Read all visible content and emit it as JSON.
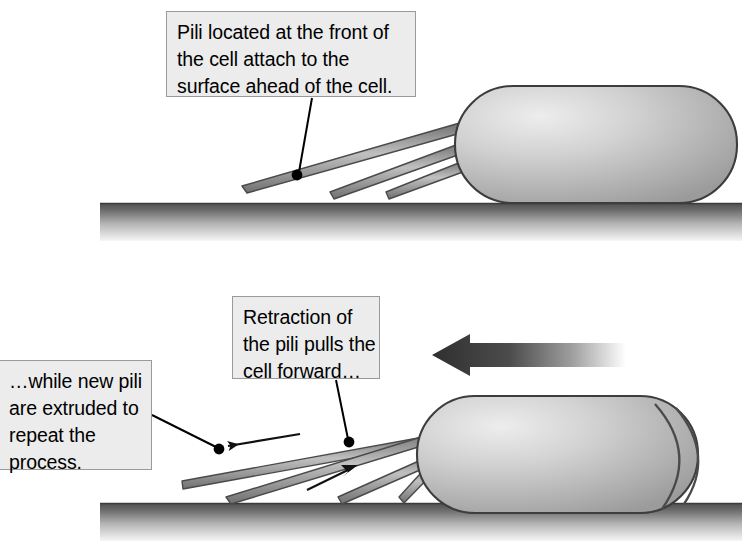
{
  "figure": {
    "type": "two-panel process diagram"
  },
  "colors": {
    "callout_fill": "#ececec",
    "callout_border": "#9a9a9a",
    "cell_outline": "#3d3d3d",
    "cell_light": "#e3e3e3",
    "cell_mid": "#b9b9b9",
    "cell_dark": "#9a9a9a",
    "pilus_outline": "#4a4a4a",
    "pilus_fill": "#b3b3b3",
    "surface_dark": "#555555",
    "surface_light": "#f2f2f2",
    "arrow_dark": "#3a3a3a",
    "leader": "#000000"
  },
  "panels": [
    {
      "id": "panel-top",
      "name": "attachment-stage",
      "callout": {
        "id": "box1",
        "lines": [
          "Pili located at the front of",
          "the cell attach to the",
          "surface ahead of the cell."
        ]
      },
      "cell": {
        "label": "bacterial-cell"
      },
      "pili_count": 3,
      "surface": {
        "label": "solid-surface"
      }
    },
    {
      "id": "panel-bottom",
      "name": "retraction-stage",
      "callouts": [
        {
          "id": "box2",
          "lines": [
            "Retraction of",
            "the pili pulls the",
            "cell forward…"
          ]
        },
        {
          "id": "box3",
          "lines": [
            "…while new pili",
            "are extruded to",
            "repeat the",
            "process."
          ]
        }
      ],
      "cell": {
        "label": "bacterial-cell"
      },
      "pili_count": 4,
      "surface": {
        "label": "solid-surface"
      },
      "direction_arrow": {
        "label": "movement-direction-arrow",
        "points": "left"
      },
      "motion_lines": 2,
      "pilus_arrows": [
        {
          "label": "extrusion-arrow",
          "points": "left"
        },
        {
          "label": "retraction-arrow",
          "points": "right"
        }
      ]
    }
  ]
}
